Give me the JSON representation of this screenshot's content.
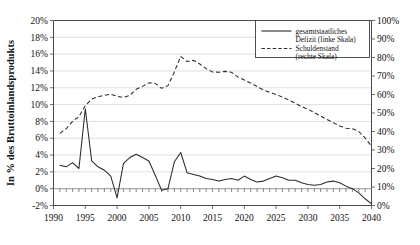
{
  "top_partial_text": "",
  "chart_data": {
    "type": "line",
    "title": "",
    "xlabel": "",
    "ylabel": "In % des Bruttoinlandsprodukts",
    "ylabel_right": "",
    "grid": true,
    "legend_position": "top-right-inside",
    "x": [
      1991,
      1992,
      1993,
      1994,
      1995,
      1996,
      1997,
      1998,
      1999,
      2000,
      2001,
      2002,
      2003,
      2004,
      2005,
      2006,
      2007,
      2008,
      2009,
      2010,
      2011,
      2012,
      2013,
      2014,
      2015,
      2016,
      2017,
      2018,
      2019,
      2020,
      2021,
      2022,
      2023,
      2024,
      2025,
      2026,
      2027,
      2028,
      2029,
      2030,
      2031,
      2032,
      2033,
      2034,
      2035,
      2036,
      2037,
      2038,
      2039,
      2040
    ],
    "xlim": [
      1990,
      2040
    ],
    "xticks": [
      "1990",
      "1995",
      "2000",
      "2005",
      "2010",
      "2015",
      "2020",
      "2025",
      "2030",
      "2035",
      "2040"
    ],
    "xtick_values": [
      1990,
      1995,
      2000,
      2005,
      2010,
      2015,
      2020,
      2025,
      2030,
      2035,
      2040
    ],
    "ylim": [
      -2,
      20
    ],
    "yticks": [
      "-2%",
      "0%",
      "2%",
      "4%",
      "6%",
      "8%",
      "10%",
      "12%",
      "14%",
      "16%",
      "18%",
      "20%"
    ],
    "ytick_values": [
      -2,
      0,
      2,
      4,
      6,
      8,
      10,
      12,
      14,
      16,
      18,
      20
    ],
    "ylim_right": [
      0,
      100
    ],
    "yticks_right": [
      "0%",
      "10%",
      "20%",
      "30%",
      "40%",
      "50%",
      "60%",
      "70%",
      "80%",
      "90%",
      "100%"
    ],
    "ytick_values_right": [
      0,
      10,
      20,
      30,
      40,
      50,
      60,
      70,
      80,
      90,
      100
    ],
    "series": [
      {
        "name": "gesamtstaatliches Defizit (linke Skala)",
        "axis": "left",
        "style": "solid",
        "color": "#2b2b2b",
        "values": [
          2.8,
          2.6,
          3.1,
          2.4,
          9.5,
          3.3,
          2.6,
          2.2,
          1.5,
          -1.1,
          3.0,
          3.7,
          4.1,
          3.7,
          3.3,
          1.6,
          -0.2,
          0.0,
          3.2,
          4.3,
          1.9,
          1.7,
          1.5,
          1.2,
          1.1,
          0.9,
          1.1,
          1.2,
          1.0,
          1.5,
          1.1,
          0.8,
          0.9,
          1.2,
          1.5,
          1.3,
          1.0,
          1.0,
          0.7,
          0.5,
          0.4,
          0.5,
          0.8,
          0.9,
          0.7,
          0.3,
          0.0,
          -0.5,
          -1.2,
          -1.8
        ]
      },
      {
        "name": "Schuldenstand (rechte Skala)",
        "axis": "right",
        "style": "dashed",
        "color": "#2b2b2b",
        "values": [
          39.0,
          41.5,
          45.5,
          48.0,
          54.0,
          57.5,
          58.8,
          59.6,
          60.2,
          59.0,
          58.4,
          59.5,
          62.8,
          64.4,
          66.3,
          66.0,
          63.3,
          64.8,
          72.2,
          80.6,
          77.8,
          78.5,
          76.5,
          74.0,
          72.2,
          72.0,
          72.5,
          72.0,
          69.5,
          67.8,
          66.2,
          64.3,
          62.5,
          61.2,
          60.0,
          58.6,
          57.0,
          55.3,
          53.5,
          52.0,
          50.2,
          48.4,
          46.5,
          44.8,
          43.0,
          41.8,
          41.5,
          40.0,
          36.5,
          32.0
        ]
      }
    ]
  },
  "legend": {
    "entries": [
      {
        "label_line1": "gesamtstaatliches",
        "label_line2": "Defizit (linke Skala)",
        "style": "solid"
      },
      {
        "label_line1": "Schuldenstand",
        "label_line2": "(rechte Skala)",
        "style": "dashed"
      }
    ]
  }
}
